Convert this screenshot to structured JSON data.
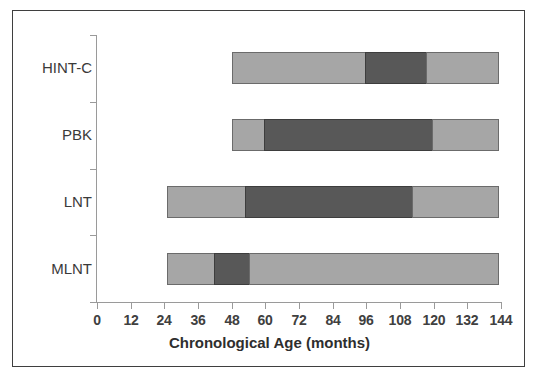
{
  "chart_data": {
    "type": "bar",
    "subtype": "horizontal-stacked-range",
    "title": "",
    "xlabel": "Chronological Age (months)",
    "ylabel": "",
    "xlim": [
      0,
      144
    ],
    "xticks": [
      0,
      12,
      24,
      36,
      48,
      60,
      72,
      84,
      96,
      108,
      120,
      132,
      144
    ],
    "xtick_labels": [
      "0",
      "12",
      "24",
      "36",
      "48",
      "60",
      "72",
      "84",
      "96",
      "108",
      "120",
      "132",
      "144"
    ],
    "grid": false,
    "legend": false,
    "categories": [
      "HINT-C",
      "PBK",
      "LNT",
      "MLNT"
    ],
    "series": [
      {
        "name": "HINT-C",
        "start": 48,
        "end": 144,
        "segments": [
          {
            "from": 48,
            "to": 96,
            "shade": "light"
          },
          {
            "from": 96,
            "to": 118,
            "shade": "dark"
          },
          {
            "from": 118,
            "to": 144,
            "shade": "light"
          }
        ]
      },
      {
        "name": "PBK",
        "start": 48,
        "end": 144,
        "segments": [
          {
            "from": 48,
            "to": 60,
            "shade": "light"
          },
          {
            "from": 60,
            "to": 120,
            "shade": "dark"
          },
          {
            "from": 120,
            "to": 144,
            "shade": "light"
          }
        ]
      },
      {
        "name": "LNT",
        "start": 25,
        "end": 144,
        "segments": [
          {
            "from": 25,
            "to": 53,
            "shade": "light"
          },
          {
            "from": 53,
            "to": 113,
            "shade": "dark"
          },
          {
            "from": 113,
            "to": 144,
            "shade": "light"
          }
        ]
      },
      {
        "name": "MLNT",
        "start": 25,
        "end": 144,
        "segments": [
          {
            "from": 25,
            "to": 42,
            "shade": "light"
          },
          {
            "from": 42,
            "to": 55,
            "shade": "dark"
          },
          {
            "from": 55,
            "to": 144,
            "shade": "light"
          }
        ]
      }
    ],
    "colors": {
      "light_segment": "#a6a6a6",
      "dark_segment": "#585858",
      "segment_border": "#6b6b6b",
      "axis": "#9a9a9a",
      "frame_border": "#3f3f3f",
      "text": "#3a3a3a",
      "background": "#ffffff"
    }
  }
}
